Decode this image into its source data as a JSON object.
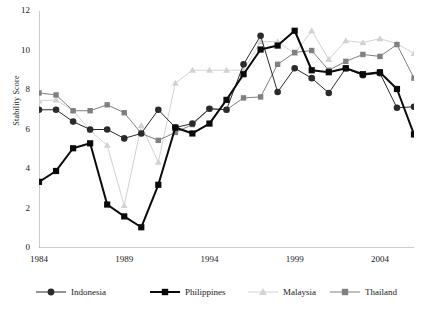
{
  "chart_data": {
    "type": "line",
    "title": "",
    "xlabel": "",
    "ylabel": "Stability Score",
    "xlim": [
      1984,
      2006
    ],
    "ylim": [
      0,
      12
    ],
    "ytick_labels": [
      "0",
      "2",
      "4",
      "6",
      "8",
      "10",
      "12"
    ],
    "ytick_values": [
      0,
      2,
      4,
      6,
      8,
      10,
      12
    ],
    "xtick_labels": [
      "1984",
      "1989",
      "1994",
      "1999",
      "2004"
    ],
    "xtick_values": [
      1984,
      1989,
      1994,
      1999,
      2004
    ],
    "grid": false,
    "legend_position": "bottom",
    "x": [
      1984,
      1985,
      1986,
      1987,
      1988,
      1989,
      1990,
      1991,
      1992,
      1993,
      1994,
      1995,
      1996,
      1997,
      1998,
      1999,
      2000,
      2001,
      2002,
      2003,
      2004,
      2005,
      2006
    ],
    "series": [
      {
        "name": "Indonesia",
        "color": "#2b2b2b",
        "marker": "circle",
        "line_width": 1,
        "values": [
          7.0,
          7.0,
          6.4,
          6.0,
          6.0,
          5.55,
          5.8,
          7.0,
          6.1,
          6.3,
          7.05,
          7.0,
          9.3,
          10.75,
          7.9,
          9.1,
          8.6,
          7.85,
          9.1,
          8.75,
          8.85,
          7.1,
          7.15
        ]
      },
      {
        "name": "Philippines",
        "color": "#0a0a0a",
        "marker": "square",
        "line_width": 2,
        "values": [
          3.35,
          3.9,
          5.05,
          5.3,
          2.2,
          1.6,
          1.05,
          3.2,
          6.1,
          5.8,
          6.3,
          7.5,
          8.8,
          10.05,
          10.25,
          11.0,
          9.0,
          8.9,
          9.1,
          8.8,
          8.9,
          8.05,
          5.75
        ]
      },
      {
        "name": "Malaysia",
        "color": "#d2d2d2",
        "marker": "triangle",
        "line_width": 1,
        "values": [
          7.45,
          7.5,
          6.95,
          5.95,
          5.2,
          2.15,
          6.2,
          4.35,
          8.35,
          9.0,
          9.0,
          9.0,
          9.0,
          10.45,
          10.45,
          9.85,
          11.0,
          9.55,
          10.5,
          10.4,
          10.6,
          10.35,
          9.85
        ]
      },
      {
        "name": "Thailand",
        "color": "#808080",
        "marker": "square",
        "line_width": 1,
        "values": [
          7.85,
          7.75,
          6.95,
          6.95,
          7.25,
          6.85,
          5.8,
          5.45,
          5.85,
          6.25,
          7.05,
          7.0,
          7.6,
          7.65,
          9.3,
          9.9,
          10.0,
          9.0,
          9.45,
          9.8,
          9.7,
          10.3,
          8.6
        ]
      }
    ]
  },
  "legend": {
    "items": [
      {
        "label": "Indonesia"
      },
      {
        "label": "Philippines"
      },
      {
        "label": "Malaysia"
      },
      {
        "label": "Thailand"
      }
    ]
  },
  "axis": {
    "y_title": "Stability Score"
  }
}
